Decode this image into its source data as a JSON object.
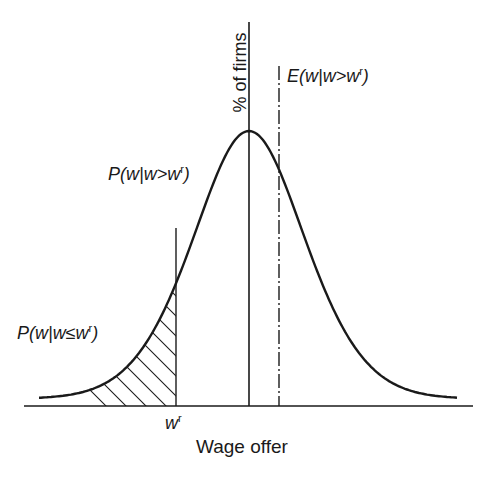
{
  "diagram": {
    "type": "wage-offer-distribution",
    "x_axis_label": "Wage offer",
    "y_axis_label": "% of firms",
    "reservation_wage_label": {
      "base": "w",
      "sup": "r"
    },
    "upper_tail_label": {
      "prefix": "P(w|w>w",
      "sup": "r",
      "suffix": ")"
    },
    "lower_tail_label": {
      "prefix": "P(w|w≤w",
      "sup": "r",
      "suffix": ")"
    },
    "expected_wage_label": {
      "prefix": "E(w|w>w",
      "sup": "r",
      "suffix": ")"
    },
    "colors": {
      "ink": "#1a1a1a",
      "background": "#ffffff"
    },
    "geometry": {
      "baseline_y": 406,
      "axis_x": 249,
      "reservation_x": 176,
      "expected_x": 279,
      "peak_y": 131
    }
  }
}
